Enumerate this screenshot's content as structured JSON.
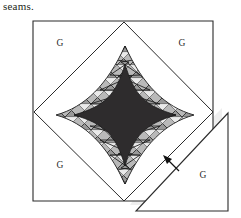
{
  "page": {
    "width": 241,
    "height": 218,
    "background_color": "#ffffff"
  },
  "caption": {
    "text": "seams."
  },
  "figure": {
    "name": "folded-square-astroid-diagram",
    "colors": {
      "outline": "#2b2b2b",
      "core_fill": "#2e2c2d",
      "band_fill": "#b7b7b7",
      "band_line": "#1f1f1f",
      "paper_fill": "#ffffff",
      "flap_shadow": "#e9e9e9",
      "label_color": "#2a2a2a"
    },
    "outer_square": {
      "corners": [
        [
          33,
          21
        ],
        [
          213,
          21
        ],
        [
          213,
          201
        ],
        [
          33,
          201
        ]
      ]
    },
    "inner_diamond": {
      "vertices": [
        [
          124,
          22
        ],
        [
          213,
          112
        ],
        [
          124,
          201
        ],
        [
          34,
          112
        ]
      ]
    },
    "astroid": {
      "center": [
        125,
        115
      ],
      "half_width": 51,
      "half_height": 51,
      "concavity": 0.58
    },
    "band": {
      "outer_offset": 20,
      "hatch_segments": 13,
      "pattern": "zigzag-lattice"
    },
    "flap": {
      "vertices": [
        [
          136,
          211
        ],
        [
          228,
          211
        ],
        [
          228,
          113
        ]
      ],
      "hinge": [
        [
          136,
          211
        ],
        [
          228,
          113
        ]
      ]
    },
    "arrow": {
      "tail": [
        178,
        170
      ],
      "tip": [
        165,
        157
      ]
    },
    "labels": [
      {
        "id": "g-top-left",
        "text": "G",
        "x": 60,
        "y": 46
      },
      {
        "id": "g-top-right",
        "text": "G",
        "x": 182,
        "y": 46
      },
      {
        "id": "g-bottom-left",
        "text": "G",
        "x": 60,
        "y": 168
      },
      {
        "id": "g-bottom-right",
        "text": "G",
        "x": 203,
        "y": 178
      }
    ]
  }
}
